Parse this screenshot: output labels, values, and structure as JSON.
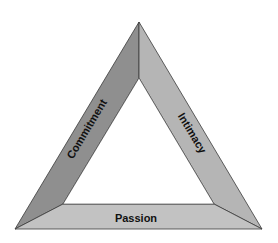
{
  "diagram": {
    "type": "triangle",
    "title": "",
    "sides": [
      {
        "id": "commitment",
        "label": "Commitment",
        "position": "left",
        "color": "#8f8f8f"
      },
      {
        "id": "intimacy",
        "label": "Intimacy",
        "position": "right",
        "color": "#b5b5b5"
      },
      {
        "id": "passion",
        "label": "Passion",
        "position": "bottom",
        "color": "#c2c2c2"
      }
    ],
    "outline_color": "#3a3a3a",
    "background": "#ffffff"
  }
}
